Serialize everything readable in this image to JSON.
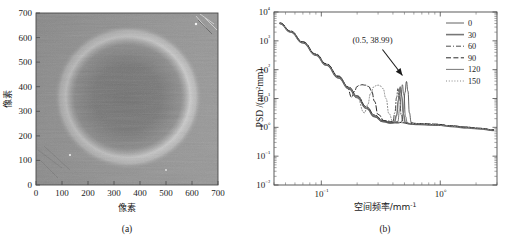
{
  "figure": {
    "panel_a": {
      "caption": "(a)",
      "xlabel": "像素",
      "ylabel": "像素",
      "xticks": [
        "0",
        "100",
        "200",
        "300",
        "400",
        "500",
        "600",
        "700"
      ],
      "yticks": [
        "0",
        "100",
        "200",
        "300",
        "400",
        "500",
        "600",
        "700"
      ],
      "xlim": [
        0,
        700
      ],
      "ylim": [
        0,
        700
      ],
      "image_description": "grayscale-surface-map",
      "colors": {
        "background_gray": "#9a9a9a",
        "ring_bright": "#d8d8d8",
        "core_dark": "#6a6a6a",
        "corner_dark": "#5e5e5e"
      }
    },
    "panel_b": {
      "caption": "(b)",
      "annotation": "(0.5, 38.99)",
      "legend_position": "top-right"
    }
  },
  "chart_data": {
    "type": "line",
    "title": "",
    "xlabel": "空间频率/mm⁻¹",
    "ylabel": "PSD /(nm²mm)",
    "xscale": "log",
    "yscale": "log",
    "xlim": [
      0.04,
      3.0
    ],
    "ylim": [
      0.01,
      10000
    ],
    "xticks": [
      0.1,
      1
    ],
    "xtick_labels": [
      "10⁻¹",
      "10⁰"
    ],
    "yticks": [
      0.01,
      0.1,
      1,
      10,
      100,
      1000,
      10000
    ],
    "ytick_labels": [
      "10⁻²",
      "10⁻¹",
      "10⁰",
      "10¹",
      "10²",
      "10³",
      "10⁴"
    ],
    "grid": false,
    "annotations": [
      {
        "text": "(0.5, 38.99)",
        "x": 0.5,
        "y": 38.99,
        "arrow": true
      }
    ],
    "series": [
      {
        "name": "0",
        "label": "0",
        "linestyle": "solid",
        "width": 0.8,
        "color": "#3a3a3a",
        "peak_x": 0.52,
        "peak_y": 38.99,
        "x": [
          0.045,
          0.055,
          0.07,
          0.09,
          0.11,
          0.14,
          0.17,
          0.2,
          0.24,
          0.28,
          0.33,
          0.39,
          0.44,
          0.47,
          0.49,
          0.505,
          0.52,
          0.535,
          0.55,
          0.57,
          0.6,
          0.7,
          0.85,
          1.0,
          1.3,
          1.7,
          2.2,
          2.8
        ],
        "y": [
          4000,
          2100,
          880,
          330,
          150,
          55,
          24,
          12,
          5.0,
          2.6,
          1.7,
          1.45,
          1.4,
          1.5,
          3.0,
          16,
          38.99,
          18,
          3.2,
          1.5,
          1.35,
          1.3,
          1.25,
          1.2,
          1.1,
          1.0,
          0.9,
          0.8
        ]
      },
      {
        "name": "30",
        "label": "30",
        "linestyle": "solid",
        "width": 1.6,
        "color": "#777777",
        "peak_x": 0.46,
        "peak_y": 25,
        "x": [
          0.045,
          0.055,
          0.07,
          0.09,
          0.11,
          0.14,
          0.17,
          0.2,
          0.24,
          0.28,
          0.33,
          0.38,
          0.41,
          0.43,
          0.445,
          0.46,
          0.475,
          0.49,
          0.51,
          0.55,
          0.65,
          0.85,
          1.0,
          1.3,
          1.7,
          2.2,
          2.8
        ],
        "y": [
          4000,
          2050,
          860,
          320,
          145,
          52,
          22,
          11,
          4.6,
          2.4,
          1.6,
          1.4,
          1.5,
          2.6,
          9.0,
          25,
          12,
          2.8,
          1.45,
          1.3,
          1.25,
          1.2,
          1.18,
          1.05,
          0.95,
          0.88,
          0.78
        ]
      },
      {
        "name": "60",
        "label": "60",
        "linestyle": "dashdot",
        "width": 0.9,
        "color": "#3a3a3a",
        "peak_x": 0.44,
        "peak_y": 22,
        "x": [
          0.045,
          0.055,
          0.07,
          0.09,
          0.11,
          0.14,
          0.17,
          0.2,
          0.24,
          0.28,
          0.33,
          0.37,
          0.4,
          0.415,
          0.43,
          0.44,
          0.455,
          0.47,
          0.49,
          0.53,
          0.65,
          0.85,
          1.0,
          1.3,
          1.7,
          2.2,
          2.8
        ],
        "y": [
          4100,
          2150,
          900,
          340,
          155,
          57,
          25,
          12.5,
          5.2,
          2.7,
          1.75,
          1.5,
          1.6,
          3.2,
          11,
          22,
          10,
          2.6,
          1.5,
          1.35,
          1.3,
          1.25,
          1.2,
          1.1,
          1.0,
          0.92,
          0.82
        ]
      },
      {
        "name": "90",
        "label": "90",
        "linestyle": "dashed",
        "width": 1.0,
        "color": "#2a2a2a",
        "peak_x": 0.22,
        "peak_y": 30,
        "x": [
          0.045,
          0.055,
          0.07,
          0.09,
          0.11,
          0.14,
          0.165,
          0.18,
          0.19,
          0.2,
          0.21,
          0.22,
          0.235,
          0.25,
          0.265,
          0.28,
          0.3,
          0.34,
          0.42,
          0.55,
          0.7,
          0.9,
          1.2,
          1.6,
          2.1,
          2.8
        ],
        "y": [
          4200,
          2200,
          930,
          350,
          160,
          60,
          26,
          11,
          18,
          26,
          29,
          30,
          29,
          26,
          18,
          8.0,
          2.8,
          1.7,
          1.5,
          1.4,
          1.35,
          1.3,
          1.15,
          1.02,
          0.93,
          0.82
        ]
      },
      {
        "name": "120",
        "label": "120",
        "linestyle": "solid",
        "width": 0.8,
        "color": "#555555",
        "peak_x": 0.48,
        "peak_y": 30,
        "x": [
          0.045,
          0.055,
          0.07,
          0.09,
          0.11,
          0.14,
          0.17,
          0.2,
          0.24,
          0.28,
          0.33,
          0.4,
          0.44,
          0.455,
          0.47,
          0.48,
          0.495,
          0.51,
          0.53,
          0.58,
          0.7,
          0.9,
          1.2,
          1.6,
          2.1,
          2.8
        ],
        "y": [
          3900,
          2000,
          840,
          315,
          142,
          51,
          22,
          10.5,
          4.4,
          2.3,
          1.55,
          1.4,
          1.6,
          4.0,
          14,
          30,
          13,
          2.4,
          1.4,
          1.3,
          1.25,
          1.2,
          1.1,
          1.0,
          0.9,
          0.8
        ]
      },
      {
        "name": "150",
        "label": "150",
        "linestyle": "dotted",
        "width": 1.0,
        "color": "#888888",
        "peak_x": 0.3,
        "peak_y": 29,
        "x": [
          0.045,
          0.055,
          0.07,
          0.09,
          0.11,
          0.14,
          0.17,
          0.2,
          0.23,
          0.245,
          0.26,
          0.275,
          0.29,
          0.3,
          0.315,
          0.33,
          0.35,
          0.37,
          0.4,
          0.47,
          0.6,
          0.8,
          1.1,
          1.5,
          2.0,
          2.8
        ],
        "y": [
          4050,
          2080,
          870,
          325,
          148,
          53,
          23,
          10.8,
          3.2,
          6.0,
          15,
          25,
          28,
          29,
          27,
          22,
          10,
          3.0,
          1.6,
          1.45,
          1.35,
          1.28,
          1.15,
          1.03,
          0.93,
          0.82
        ]
      }
    ]
  }
}
